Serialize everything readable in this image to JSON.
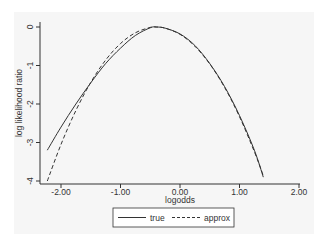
{
  "chart_data": {
    "type": "line",
    "title": "",
    "xlabel": "logodds",
    "ylabel": "log likelihood ratio",
    "xlim": [
      -2.3,
      2.0
    ],
    "ylim": [
      -4,
      0
    ],
    "xticks": [
      "-2.00",
      "-1.00",
      "0.00",
      "1.00",
      "2.00"
    ],
    "xtick_values": [
      -2,
      -1,
      0,
      1,
      2
    ],
    "yticks": [
      "0",
      "-1",
      "-2",
      "-3",
      "-4"
    ],
    "ytick_values": [
      0,
      -1,
      -2,
      -3,
      -4
    ],
    "grid": false,
    "legend_position": "bottom",
    "series": [
      {
        "name": "true",
        "style": "solid",
        "x": [
          -2.23,
          -2.0,
          -1.75,
          -1.5,
          -1.25,
          -1.0,
          -0.75,
          -0.5,
          -0.4,
          -0.25,
          0.0,
          0.25,
          0.5,
          0.75,
          1.0,
          1.25,
          1.4
        ],
        "y": [
          -3.2,
          -2.6,
          -2.0,
          -1.45,
          -0.95,
          -0.55,
          -0.22,
          -0.02,
          0.0,
          -0.03,
          -0.18,
          -0.48,
          -0.95,
          -1.55,
          -2.3,
          -3.2,
          -3.9
        ]
      },
      {
        "name": "approx",
        "style": "dashed",
        "x": [
          -2.23,
          -2.0,
          -1.75,
          -1.5,
          -1.25,
          -1.0,
          -0.75,
          -0.5,
          -0.4,
          -0.25,
          0.0,
          0.25,
          0.5,
          0.75,
          1.0,
          1.25,
          1.4
        ],
        "y": [
          -4.0,
          -3.05,
          -2.17,
          -1.44,
          -0.86,
          -0.43,
          -0.15,
          -0.01,
          0.0,
          -0.03,
          -0.19,
          -0.5,
          -0.96,
          -1.57,
          -2.33,
          -3.24,
          -3.86
        ]
      }
    ]
  },
  "legend": {
    "true_label": "true",
    "approx_label": "approx"
  }
}
